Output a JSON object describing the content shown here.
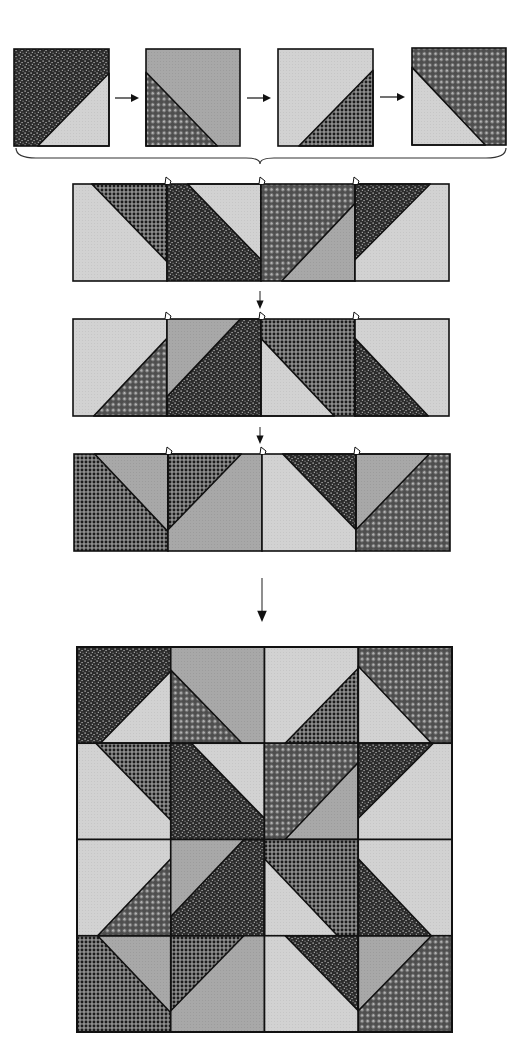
{
  "diagram": {
    "type": "quilt-block-assembly",
    "fabrics": {
      "dark-speckle": {
        "label": "dark speckled print",
        "base": "#2b2b2b",
        "accent": "#d8d8d8"
      },
      "dark-grid": {
        "label": "dark grid print",
        "base": "#3a3a3a",
        "accent": "#9a9a9a"
      },
      "basketweave": {
        "label": "basketweave print",
        "base": "#555555",
        "accent": "#e2e2e2"
      },
      "medium-gray": {
        "label": "medium gray solid",
        "base": "#a6a6a6"
      },
      "light-gray": {
        "label": "light gray solid",
        "base": "#d0d0d0"
      }
    },
    "colors": {
      "outline": "#111111",
      "arrow": "#111111",
      "background": "#ffffff"
    },
    "top_units": [
      {
        "x": 14,
        "y": 49,
        "w": 95,
        "h": 97,
        "bg": "dark-speckle",
        "tri": "light-gray",
        "pts": [
          [
            1,
            0.25
          ],
          [
            1,
            1
          ],
          [
            0.25,
            1
          ]
        ]
      },
      {
        "x": 146,
        "y": 49,
        "w": 94,
        "h": 97,
        "bg": "medium-gray",
        "tri": "basketweave",
        "pts": [
          [
            0,
            0.24
          ],
          [
            0,
            1
          ],
          [
            0.76,
            1
          ]
        ]
      },
      {
        "x": 278,
        "y": 49,
        "w": 95,
        "h": 97,
        "bg": "light-gray",
        "tri": "dark-grid",
        "pts": [
          [
            1,
            0.22
          ],
          [
            1,
            1
          ],
          [
            0.22,
            1
          ]
        ]
      },
      {
        "x": 412,
        "y": 48,
        "w": 94,
        "h": 97,
        "bg": "basketweave",
        "tri": "light-gray",
        "pts": [
          [
            0,
            0.2
          ],
          [
            0,
            1
          ],
          [
            0.78,
            1
          ]
        ]
      }
    ],
    "top_arrows": [
      {
        "x1": 115,
        "x2": 139,
        "y": 98
      },
      {
        "x1": 247,
        "x2": 271,
        "y": 98
      },
      {
        "x1": 380,
        "x2": 405,
        "y": 97
      }
    ],
    "brace": {
      "x1": 16,
      "x2": 506,
      "y": 152,
      "mid": 260,
      "depth": 12
    },
    "strips": [
      {
        "name": "row-1",
        "x": 73,
        "y": 184,
        "w": 376,
        "h": 97,
        "units": [
          {
            "bg": "light-gray",
            "tri": "dark-grid",
            "pts": [
              [
                0.2,
                0
              ],
              [
                1,
                0
              ],
              [
                1,
                0.8
              ]
            ]
          },
          {
            "bg": "dark-speckle",
            "tri": "light-gray",
            "pts": [
              [
                0.22,
                0
              ],
              [
                1,
                0
              ],
              [
                1,
                0.78
              ]
            ]
          },
          {
            "bg": "basketweave",
            "tri": "medium-gray",
            "pts": [
              [
                1,
                0.2
              ],
              [
                1,
                1
              ],
              [
                0.22,
                1
              ]
            ]
          },
          {
            "bg": "light-gray",
            "tri": "dark-speckle",
            "pts": [
              [
                0,
                0
              ],
              [
                0.8,
                0
              ],
              [
                0,
                0.78
              ]
            ]
          }
        ],
        "notches": [
          166,
          260,
          354
        ]
      },
      {
        "name": "row-2",
        "x": 73,
        "y": 319,
        "w": 376,
        "h": 97,
        "units": [
          {
            "bg": "light-gray",
            "tri": "basketweave",
            "pts": [
              [
                1,
                0.2
              ],
              [
                1,
                1
              ],
              [
                0.22,
                1
              ]
            ]
          },
          {
            "bg": "medium-gray",
            "tri": "dark-speckle",
            "pts": [
              [
                0.78,
                0
              ],
              [
                1,
                0
              ],
              [
                1,
                1
              ],
              [
                0,
                1
              ],
              [
                0,
                0.8
              ]
            ]
          },
          {
            "bg": "dark-grid",
            "tri": "light-gray",
            "pts": [
              [
                0,
                0.2
              ],
              [
                0,
                1
              ],
              [
                0.78,
                1
              ]
            ]
          },
          {
            "bg": "light-gray",
            "tri": "dark-speckle",
            "pts": [
              [
                0,
                0.2
              ],
              [
                0,
                1
              ],
              [
                0.78,
                1
              ]
            ]
          }
        ],
        "notches": [
          166,
          260,
          354
        ]
      },
      {
        "name": "row-3",
        "x": 74,
        "y": 454,
        "w": 376,
        "h": 97,
        "units": [
          {
            "bg": "dark-grid",
            "tri": "medium-gray",
            "pts": [
              [
                0.22,
                0
              ],
              [
                1,
                0
              ],
              [
                1,
                0.8
              ]
            ]
          },
          {
            "bg": "medium-gray",
            "tri": "dark-grid",
            "pts": [
              [
                0,
                0
              ],
              [
                0.78,
                0
              ],
              [
                0,
                0.78
              ]
            ]
          },
          {
            "bg": "light-gray",
            "tri": "dark-speckle",
            "pts": [
              [
                0.22,
                0
              ],
              [
                1,
                0
              ],
              [
                1,
                0.78
              ]
            ]
          },
          {
            "bg": "basketweave",
            "tri": "medium-gray",
            "pts": [
              [
                0,
                0
              ],
              [
                0.78,
                0
              ],
              [
                0,
                0.78
              ]
            ]
          }
        ],
        "notches": [
          166,
          260,
          354
        ]
      }
    ],
    "strip_arrows": [
      {
        "x": 260,
        "y1": 291,
        "y2": 309,
        "head": 6
      },
      {
        "x": 260,
        "y1": 427,
        "y2": 444,
        "head": 6
      },
      {
        "x": 262,
        "y1": 578,
        "y2": 622,
        "head": 8
      }
    ],
    "final_block": {
      "x": 77,
      "y": 647,
      "w": 375,
      "h": 385,
      "rows": [
        [
          {
            "bg": "dark-speckle",
            "tri": "light-gray",
            "pts": [
              [
                1,
                0.25
              ],
              [
                1,
                1
              ],
              [
                0.25,
                1
              ]
            ]
          },
          {
            "bg": "medium-gray",
            "tri": "basketweave",
            "pts": [
              [
                0,
                0.24
              ],
              [
                0,
                1
              ],
              [
                0.76,
                1
              ]
            ]
          },
          {
            "bg": "light-gray",
            "tri": "dark-grid",
            "pts": [
              [
                1,
                0.22
              ],
              [
                1,
                1
              ],
              [
                0.22,
                1
              ]
            ]
          },
          {
            "bg": "basketweave",
            "tri": "light-gray",
            "pts": [
              [
                0,
                0.2
              ],
              [
                0,
                1
              ],
              [
                0.78,
                1
              ]
            ]
          }
        ],
        [
          {
            "bg": "light-gray",
            "tri": "dark-grid",
            "pts": [
              [
                0.2,
                0
              ],
              [
                1,
                0
              ],
              [
                1,
                0.8
              ]
            ]
          },
          {
            "bg": "dark-speckle",
            "tri": "light-gray",
            "pts": [
              [
                0.22,
                0
              ],
              [
                1,
                0
              ],
              [
                1,
                0.78
              ]
            ]
          },
          {
            "bg": "basketweave",
            "tri": "medium-gray",
            "pts": [
              [
                1,
                0.2
              ],
              [
                1,
                1
              ],
              [
                0.22,
                1
              ]
            ]
          },
          {
            "bg": "light-gray",
            "tri": "dark-speckle",
            "pts": [
              [
                0,
                0
              ],
              [
                0.8,
                0
              ],
              [
                0,
                0.78
              ]
            ]
          }
        ],
        [
          {
            "bg": "light-gray",
            "tri": "basketweave",
            "pts": [
              [
                1,
                0.2
              ],
              [
                1,
                1
              ],
              [
                0.22,
                1
              ]
            ]
          },
          {
            "bg": "medium-gray",
            "tri": "dark-speckle",
            "pts": [
              [
                0.78,
                0
              ],
              [
                1,
                0
              ],
              [
                1,
                1
              ],
              [
                0,
                1
              ],
              [
                0,
                0.8
              ]
            ]
          },
          {
            "bg": "dark-grid",
            "tri": "light-gray",
            "pts": [
              [
                0,
                0.2
              ],
              [
                0,
                1
              ],
              [
                0.78,
                1
              ]
            ]
          },
          {
            "bg": "light-gray",
            "tri": "dark-speckle",
            "pts": [
              [
                0,
                0.2
              ],
              [
                0,
                1
              ],
              [
                0.78,
                1
              ]
            ]
          }
        ],
        [
          {
            "bg": "dark-grid",
            "tri": "medium-gray",
            "pts": [
              [
                0.22,
                0
              ],
              [
                1,
                0
              ],
              [
                1,
                0.8
              ]
            ]
          },
          {
            "bg": "medium-gray",
            "tri": "dark-grid",
            "pts": [
              [
                0,
                0
              ],
              [
                0.78,
                0
              ],
              [
                0,
                0.78
              ]
            ]
          },
          {
            "bg": "light-gray",
            "tri": "dark-speckle",
            "pts": [
              [
                0.22,
                0
              ],
              [
                1,
                0
              ],
              [
                1,
                0.78
              ]
            ]
          },
          {
            "bg": "basketweave",
            "tri": "medium-gray",
            "pts": [
              [
                0,
                0
              ],
              [
                0.78,
                0
              ],
              [
                0,
                0.78
              ]
            ]
          }
        ]
      ]
    }
  }
}
